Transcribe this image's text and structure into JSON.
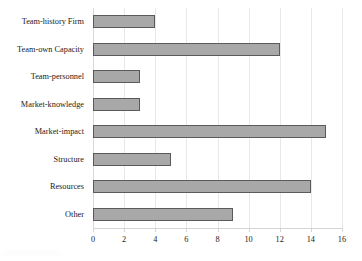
{
  "chart_data": {
    "type": "bar",
    "orientation": "horizontal",
    "title": "",
    "subtitle": "",
    "xlabel": "",
    "ylabel": "",
    "categories": [
      "Team-history Firm",
      "Team-own Capacity",
      "Team-personnel",
      "Market-knowledge",
      "Market-impact",
      "Structure",
      "Resources",
      "Other"
    ],
    "values": [
      4,
      12,
      3,
      3,
      15,
      5,
      14,
      9
    ],
    "xlim": [
      0,
      16
    ],
    "xticks": [
      0,
      2,
      4,
      6,
      8,
      10,
      12,
      14,
      16
    ],
    "xtick_labels": [
      "0",
      "2",
      "4",
      "6",
      "8",
      "10",
      "12",
      "14",
      "16"
    ],
    "grid": "vertical",
    "legend": "none",
    "annotations": [],
    "colors": {
      "bar_fill": "#a8a8a8",
      "bar_border": "#5a5a5a",
      "gridline": "#e8e8e8",
      "axis": "#d5d5d5",
      "text": "#1a1a1a",
      "background": "#ffffff"
    }
  }
}
